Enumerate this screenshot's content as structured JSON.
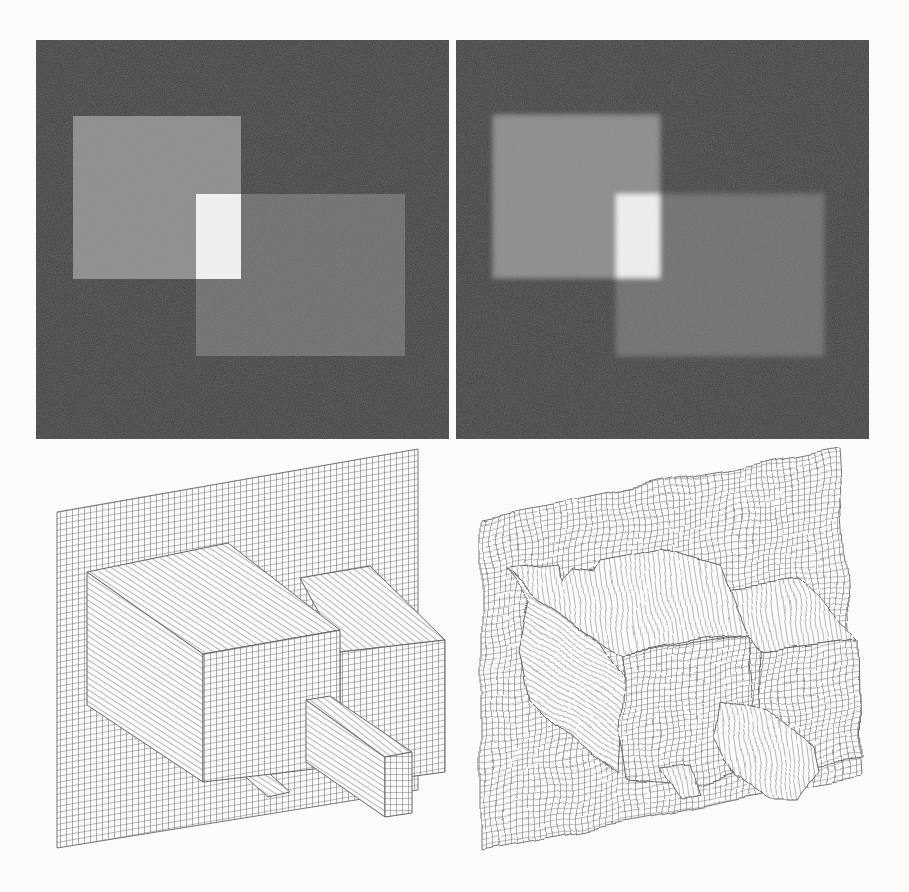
{
  "figure": {
    "background": "#fbfbfa",
    "panels": {
      "top_left": {
        "kind": "intensity-image",
        "state": "sharp",
        "rect": [
          36,
          40,
          413,
          399
        ],
        "regions": {
          "background": {
            "color": "#3d3d3d"
          },
          "light_square": {
            "rect": [
              73,
              116,
              168,
              163
            ],
            "color": "#8b8b8b"
          },
          "mid_rect": {
            "rect": [
              196,
              194,
              209,
              162
            ],
            "color": "#6b6b6b"
          },
          "overlap": {
            "rect": [
              196,
              194,
              45,
              85
            ],
            "color": "#f3f3f3"
          }
        }
      },
      "top_right": {
        "kind": "intensity-image",
        "state": "blurred",
        "rect": [
          456,
          40,
          413,
          399
        ],
        "regions": {
          "background": {
            "color": "#3e3e3e"
          },
          "light_square": {
            "rect": [
              493,
              115,
              167,
              163
            ],
            "color": "#8a8a8a"
          },
          "mid_rect": {
            "rect": [
              616,
              194,
              208,
              162
            ],
            "color": "#6c6c6c"
          },
          "overlap": {
            "rect": [
              616,
              194,
              44,
              84
            ],
            "color": "#f0f0f0"
          }
        }
      },
      "bottom_left": {
        "kind": "wireframe-surface-plot",
        "state": "clean",
        "line_color": "#7a7a7a"
      },
      "bottom_right": {
        "kind": "wireframe-surface-plot",
        "state": "noisy",
        "line_color": "#7a7a7a"
      }
    }
  }
}
